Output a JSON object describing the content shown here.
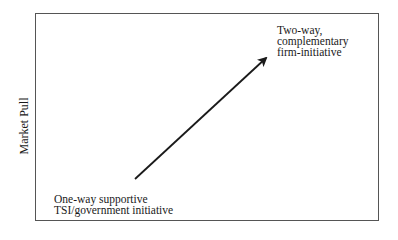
{
  "diagram": {
    "y_axis_label": "Market Pull",
    "top_label": {
      "lines": [
        "Two-way,",
        "complementary",
        "firm-initiative"
      ]
    },
    "bottom_label": {
      "lines": [
        "One-way supportive",
        "TSI/government initiative"
      ]
    },
    "arrow": {
      "from": "One-way supportive TSI/government initiative",
      "to": "Two-way, complementary firm-initiative",
      "color": "#1a1a1a"
    },
    "frame_color": "#555555"
  }
}
